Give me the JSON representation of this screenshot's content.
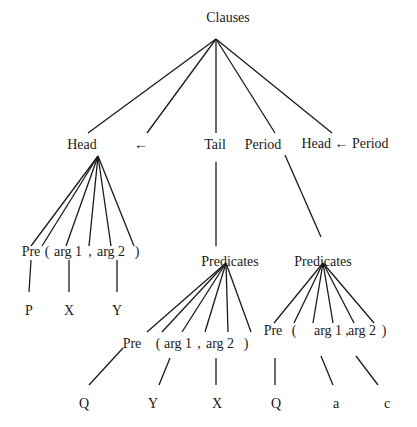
{
  "diagram": {
    "type": "parse-tree",
    "root": {
      "id": "clauses",
      "label": "Clauses",
      "x": 228,
      "y": 18,
      "apex": [
        216,
        39
      ]
    },
    "level1": [
      {
        "id": "head",
        "label": "Head",
        "x": 82,
        "y": 145,
        "end": [
          88,
          133
        ]
      },
      {
        "id": "arrow",
        "label": "←",
        "x": 141,
        "y": 145,
        "end": [
          147,
          133
        ]
      },
      {
        "id": "tail",
        "label": "Tail",
        "x": 215,
        "y": 145,
        "end": [
          216,
          133
        ]
      },
      {
        "id": "period",
        "label": "Period",
        "x": 263,
        "y": 145,
        "end": [
          275,
          133
        ]
      },
      {
        "id": "head-arrow-period",
        "label": "Head ← Period",
        "x": 345,
        "y": 144,
        "end": [
          332,
          133
        ]
      }
    ],
    "head_subtree": {
      "apex": [
        98,
        156
      ],
      "children": [
        {
          "label": "Pre",
          "x": 31,
          "y": 252,
          "end": [
            31,
            246
          ]
        },
        {
          "label": "(",
          "x": 47,
          "y": 252,
          "end": [
            42,
            246
          ]
        },
        {
          "label": "arg 1",
          "x": 68,
          "y": 252,
          "end": [
            66,
            246
          ]
        },
        {
          "label": ",",
          "x": 90,
          "y": 252,
          "end": [
            89,
            246
          ]
        },
        {
          "label": "arg 2",
          "x": 111,
          "y": 252,
          "end": [
            111,
            246
          ]
        },
        {
          "label": ")",
          "x": 137,
          "y": 252,
          "end": [
            134,
            246
          ]
        }
      ],
      "leaves": [
        {
          "label": "P",
          "x": 29,
          "y": 311,
          "from": [
            31,
            260
          ],
          "to": [
            29,
            292
          ]
        },
        {
          "label": "X",
          "x": 69,
          "y": 311,
          "from": [
            69,
            260
          ],
          "to": [
            69,
            292
          ]
        },
        {
          "label": "Y",
          "x": 117,
          "y": 311,
          "from": [
            117,
            260
          ],
          "to": [
            117,
            292
          ]
        }
      ]
    },
    "tail_subtree": {
      "link": {
        "from": [
          216,
          162
        ],
        "to": [
          216,
          246
        ]
      },
      "predicates": {
        "label": "Predicates",
        "x": 230,
        "y": 262,
        "apex": [
          226,
          263
        ]
      },
      "children": [
        {
          "label": "Pre",
          "x": 132,
          "y": 344,
          "end": [
            147,
            332
          ]
        },
        {
          "label": "(",
          "x": 158,
          "y": 344,
          "end": [
            162,
            332
          ]
        },
        {
          "label": "arg 1",
          "x": 178,
          "y": 344,
          "end": [
            182,
            332
          ]
        },
        {
          "label": ",",
          "x": 199,
          "y": 344,
          "end": [
            205,
            332
          ]
        },
        {
          "label": "arg 2",
          "x": 220,
          "y": 344,
          "end": [
            228,
            332
          ]
        },
        {
          "label": ")",
          "x": 246,
          "y": 344,
          "end": [
            251,
            332
          ]
        }
      ],
      "leaves": [
        {
          "label": "Q",
          "x": 84,
          "y": 404,
          "from": [
            123,
            348
          ],
          "to": [
            89,
            385
          ]
        },
        {
          "label": "Y",
          "x": 153,
          "y": 404,
          "from": [
            170,
            358
          ],
          "to": [
            159,
            385
          ]
        },
        {
          "label": "X",
          "x": 217,
          "y": 404,
          "from": [
            216,
            358
          ],
          "to": [
            216,
            385
          ]
        }
      ]
    },
    "period_subtree": {
      "link": {
        "from": [
          285,
          155
        ],
        "to": [
          321,
          237
        ]
      },
      "predicates": {
        "label": "Predicates",
        "x": 323,
        "y": 262,
        "apex": [
          323,
          263
        ]
      },
      "children": [
        {
          "label": "Pre",
          "x": 273,
          "y": 331,
          "end": [
            274,
            323
          ]
        },
        {
          "label": "(",
          "x": 294,
          "y": 331,
          "end": [
            294,
            323
          ]
        },
        {
          "label": "arg 1",
          "x": 328,
          "y": 331,
          "end": [
            313,
            323
          ]
        },
        {
          "label": ",",
          "x": 347,
          "y": 331,
          "end": [
            333,
            323
          ]
        },
        {
          "label": "arg 2",
          "x": 362,
          "y": 331,
          "end": [
            354,
            323
          ]
        },
        {
          "label": ")",
          "x": 384,
          "y": 331,
          "end": [
            374,
            323
          ]
        }
      ],
      "leaves": [
        {
          "label": "Q",
          "x": 276,
          "y": 404,
          "from": [
            275,
            358
          ],
          "to": [
            275,
            385
          ]
        },
        {
          "label": "a",
          "x": 336,
          "y": 404,
          "from": [
            321,
            356
          ],
          "to": [
            333,
            385
          ]
        },
        {
          "label": "c",
          "x": 387,
          "y": 404,
          "from": [
            356,
            356
          ],
          "to": [
            378,
            385
          ]
        }
      ]
    }
  }
}
